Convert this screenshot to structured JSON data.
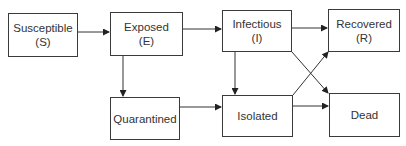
{
  "nodes": {
    "susceptible": {
      "label": "Susceptible",
      "abbr": "(S)"
    },
    "exposed": {
      "label": "Exposed",
      "abbr": "(E)"
    },
    "infectious": {
      "label": "Infectious",
      "abbr": "(I)"
    },
    "recovered": {
      "label": "Recovered",
      "abbr": "(R)"
    },
    "quarantined": {
      "label": "Quarantined"
    },
    "isolated": {
      "label": "Isolated"
    },
    "dead": {
      "label": "Dead"
    }
  },
  "edges": [
    {
      "from": "susceptible",
      "to": "exposed"
    },
    {
      "from": "exposed",
      "to": "infectious"
    },
    {
      "from": "exposed",
      "to": "quarantined"
    },
    {
      "from": "infectious",
      "to": "recovered"
    },
    {
      "from": "infectious",
      "to": "isolated"
    },
    {
      "from": "infectious",
      "to": "dead"
    },
    {
      "from": "quarantined",
      "to": "isolated"
    },
    {
      "from": "isolated",
      "to": "recovered"
    },
    {
      "from": "isolated",
      "to": "dead"
    }
  ],
  "colors": {
    "stroke": "#3a3a3a",
    "text": "#333333"
  }
}
